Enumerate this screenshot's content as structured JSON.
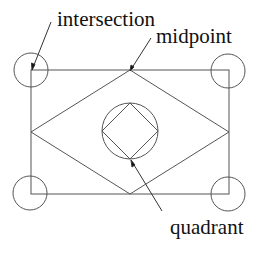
{
  "diagram": {
    "type": "snap-points illustration",
    "stroke_color": "#555555",
    "text_color": "#111111",
    "labels": {
      "intersection": "intersection",
      "midpoint": "midpoint",
      "quadrant": "quadrant"
    },
    "shapes": {
      "rectangle": {
        "x": 31,
        "y": 70,
        "width": 198,
        "height": 124
      },
      "outer_diamond": {
        "top": [
          130,
          70
        ],
        "right": [
          229,
          132
        ],
        "bottom": [
          130,
          194
        ],
        "left": [
          31,
          132
        ]
      },
      "center_circle": {
        "cx": 130,
        "cy": 131,
        "r": 28
      },
      "inner_diamond": {
        "top": [
          130,
          103
        ],
        "right": [
          158,
          131
        ],
        "bottom": [
          130,
          159
        ],
        "left": [
          102,
          131
        ]
      },
      "corner_circles": [
        {
          "name": "top-left",
          "cx": 31,
          "cy": 70,
          "r": 17
        },
        {
          "name": "top-right",
          "cx": 228,
          "cy": 71,
          "r": 17
        },
        {
          "name": "bottom-left",
          "cx": 30,
          "cy": 193,
          "r": 17
        },
        {
          "name": "bottom-right",
          "cx": 228,
          "cy": 194,
          "r": 17
        }
      ]
    },
    "leaders": [
      {
        "label": "intersection",
        "from": [
          51,
          22
        ],
        "to": [
          32,
          70
        ]
      },
      {
        "label": "midpoint",
        "from": [
          151,
          38
        ],
        "to": [
          130,
          71
        ]
      },
      {
        "label": "quadrant",
        "from": [
          162,
          211
        ],
        "to": [
          131,
          160
        ]
      }
    ]
  }
}
